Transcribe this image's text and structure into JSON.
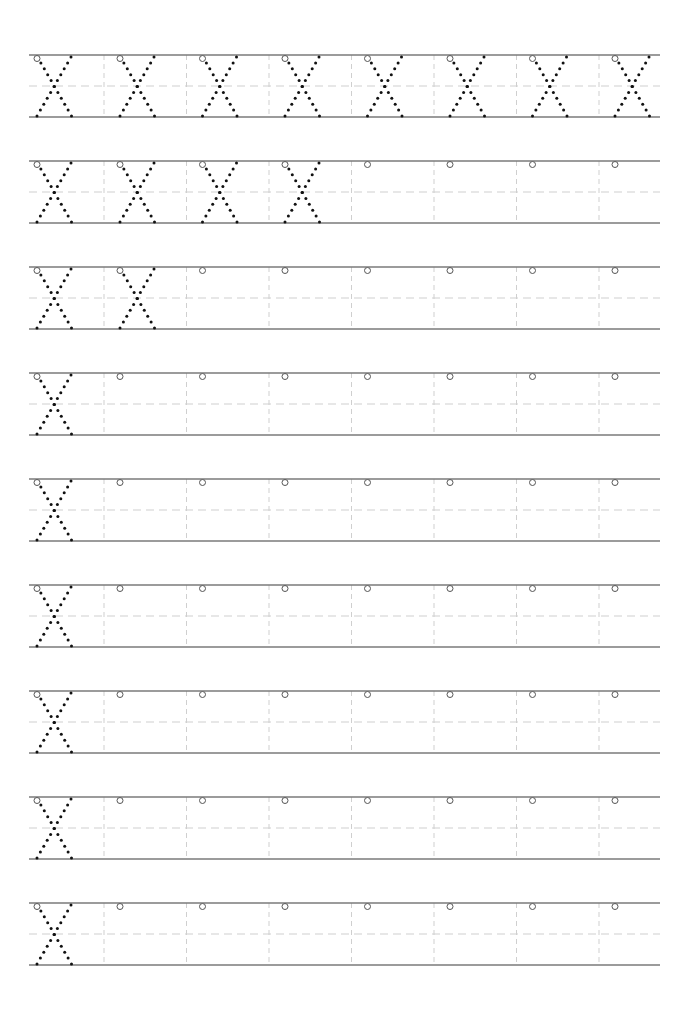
{
  "worksheet": {
    "letter": "X",
    "type": "letter tracing practice",
    "rows": [
      {
        "traced_letters": 8,
        "empty_cells": 0
      },
      {
        "traced_letters": 4,
        "empty_cells": 4
      },
      {
        "traced_letters": 2,
        "empty_cells": 6
      },
      {
        "traced_letters": 1,
        "empty_cells": 7
      },
      {
        "traced_letters": 1,
        "empty_cells": 7
      },
      {
        "traced_letters": 1,
        "empty_cells": 7
      },
      {
        "traced_letters": 1,
        "empty_cells": 7
      },
      {
        "traced_letters": 1,
        "empty_cells": 7
      },
      {
        "traced_letters": 1,
        "empty_cells": 7
      }
    ],
    "cells_per_row": 8,
    "layout": {
      "left": 29,
      "right": 660,
      "first_row_top": 55,
      "row_spacing": 106,
      "row_height": 62,
      "cell_width": 82.5
    },
    "colors": {
      "solid_line": "#7a7a7a",
      "dashed_line": "#cfcfcf",
      "dots": "#111111",
      "start_circle": "#555555",
      "background": "#ffffff"
    }
  }
}
